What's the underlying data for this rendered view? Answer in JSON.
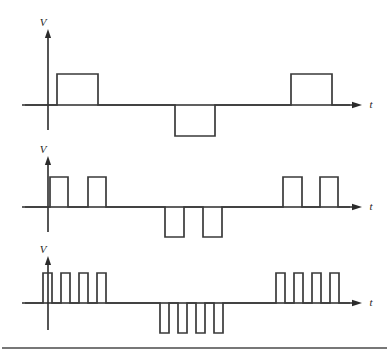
{
  "figure": {
    "background_color": "#ffffff",
    "trace_color": "#3a3a3a",
    "axis_color": "#2b2b2b",
    "width": 389,
    "height": 357,
    "footer_rule": {
      "present": true,
      "y": 348,
      "x_start": 2,
      "x_end": 387,
      "color": "#4a4a4a"
    }
  },
  "chart_data": {
    "type": "line",
    "xlabel": "t",
    "ylabel": "V",
    "grid": false,
    "legend": false,
    "axis_labels": {
      "vertical": "V",
      "horizontal": "t"
    },
    "plots": [
      {
        "index": 1,
        "name": "waveform-1",
        "label_v": "V",
        "label_t": "t",
        "baseline_y": 105,
        "amplitude_px": 31,
        "axis_x": 48,
        "axis_top_y": 28,
        "axis_bottom_y": 130,
        "t_axis_start_x": 22,
        "t_axis_end_x": 362,
        "pulse_count_positive": 2,
        "pulse_count_negative": 1,
        "pulse_width_px": 41,
        "pulses": [
          {
            "start": 57,
            "end": 98,
            "level": 1
          },
          {
            "start": 175,
            "end": 215,
            "level": -1
          },
          {
            "start": 291,
            "end": 332,
            "level": 1
          }
        ]
      },
      {
        "index": 2,
        "name": "waveform-2",
        "label_v": "V",
        "label_t": "t",
        "baseline_y": 207,
        "amplitude_px": 30,
        "axis_x": 48,
        "axis_top_y": 155,
        "axis_bottom_y": 232,
        "t_axis_start_x": 22,
        "t_axis_end_x": 362,
        "pulse_count_positive": 4,
        "pulse_count_negative": 2,
        "pulse_width_px": 19,
        "pulses": [
          {
            "start": 50,
            "end": 68,
            "level": 1
          },
          {
            "start": 88,
            "end": 106,
            "level": 1
          },
          {
            "start": 165,
            "end": 184,
            "level": -1
          },
          {
            "start": 203,
            "end": 222,
            "level": -1
          },
          {
            "start": 283,
            "end": 302,
            "level": 1
          },
          {
            "start": 320,
            "end": 338,
            "level": 1
          }
        ]
      },
      {
        "index": 3,
        "name": "waveform-3",
        "label_v": "V",
        "label_t": "t",
        "baseline_y": 303,
        "amplitude_px": 30,
        "axis_x": 48,
        "axis_top_y": 255,
        "axis_bottom_y": 330,
        "t_axis_start_x": 22,
        "t_axis_end_x": 362,
        "pulse_count_positive": 8,
        "pulse_count_negative": 4,
        "pulse_width_px": 9,
        "pulses": [
          {
            "start": 43,
            "end": 52,
            "level": 1
          },
          {
            "start": 61,
            "end": 70,
            "level": 1
          },
          {
            "start": 79,
            "end": 88,
            "level": 1
          },
          {
            "start": 97,
            "end": 106,
            "level": 1
          },
          {
            "start": 160,
            "end": 169,
            "level": -1
          },
          {
            "start": 178,
            "end": 187,
            "level": -1
          },
          {
            "start": 196,
            "end": 205,
            "level": -1
          },
          {
            "start": 214,
            "end": 223,
            "level": -1
          },
          {
            "start": 276,
            "end": 285,
            "level": 1
          },
          {
            "start": 294,
            "end": 303,
            "level": 1
          },
          {
            "start": 312,
            "end": 321,
            "level": 1
          },
          {
            "start": 330,
            "end": 339,
            "level": 1
          }
        ]
      }
    ]
  }
}
